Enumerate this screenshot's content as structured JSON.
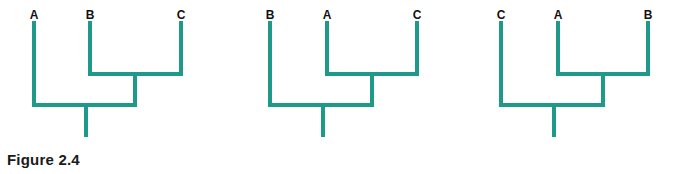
{
  "figure": {
    "caption": "Figure 2.4",
    "line_color": "#1f9a8a",
    "label_color": "#111111"
  },
  "trees": [
    {
      "tips": [
        {
          "label": "A",
          "x": 34
        },
        {
          "label": "B",
          "x": 90
        },
        {
          "label": "C",
          "x": 181
        }
      ],
      "inner_pair": [
        "B",
        "C"
      ],
      "inner_join_x": 135,
      "root_x": 86
    },
    {
      "tips": [
        {
          "label": "B",
          "x": 270
        },
        {
          "label": "A",
          "x": 327
        },
        {
          "label": "C",
          "x": 417
        }
      ],
      "inner_pair": [
        "A",
        "C"
      ],
      "inner_join_x": 372,
      "root_x": 323
    },
    {
      "tips": [
        {
          "label": "C",
          "x": 501
        },
        {
          "label": "A",
          "x": 558
        },
        {
          "label": "B",
          "x": 648
        }
      ],
      "inner_pair": [
        "A",
        "B"
      ],
      "inner_join_x": 603,
      "root_x": 554
    }
  ]
}
